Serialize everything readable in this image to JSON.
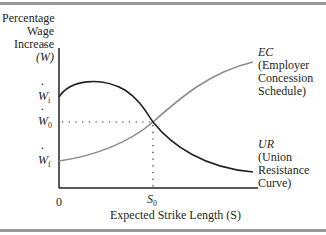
{
  "diagram": {
    "y_axis": {
      "label_lines": [
        "Percentage",
        "Wage",
        "Increase",
        "(W)"
      ],
      "ticks": [
        {
          "symbol": "W",
          "subscript": "i",
          "y": 97
        },
        {
          "symbol": "W",
          "subscript": "0",
          "y": 122
        },
        {
          "symbol": "W",
          "subscript": "f",
          "y": 161
        }
      ]
    },
    "x_axis": {
      "label": "Expected Strike Length (S)",
      "origin": "0",
      "tick": {
        "symbol": "S",
        "subscript": "0"
      }
    },
    "curves": [
      {
        "id": "EC",
        "abbr": "EC",
        "lines": [
          "(Employer",
          "Concession",
          "Schedule)"
        ],
        "color": "#8c8c8c"
      },
      {
        "id": "UR",
        "abbr": "UR",
        "lines": [
          "(Union",
          "Resistance",
          "Curve)"
        ],
        "color": "#231f20"
      }
    ],
    "intersection": {
      "x_label": "S0",
      "y_label": "W0"
    }
  }
}
